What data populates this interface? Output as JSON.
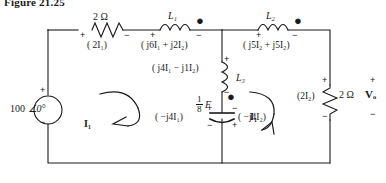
{
  "figure": {
    "title": "Figure 21.25"
  },
  "source": {
    "label": "100",
    "angle": "∠0°",
    "plus": "+",
    "minus": "−"
  },
  "components": {
    "resistor_top": {
      "value": "2 Ω",
      "drop": "( 2I₁)",
      "plus": "+",
      "minus": "−"
    },
    "inductor_L1": {
      "name": "L₁",
      "drop": "( j6I₁ + j2I₂)",
      "plus": "+",
      "minus": "−",
      "dot": "●"
    },
    "inductor_L2": {
      "name": "L₂",
      "drop": "( j5I₂ + j5I₂)",
      "plus": "+",
      "minus": "−",
      "dot": "●"
    },
    "inductor_L3": {
      "name": "L₃",
      "drop": "( j4I₁ − j1I₂)",
      "plus": "+",
      "minus": "−",
      "dot": "●"
    },
    "capacitor": {
      "value_num": "1",
      "value_den": "8",
      "value_unit": "F",
      "drop_left": "( −j4I₁)",
      "drop_right": "( −j4I₂)",
      "plus": "+",
      "minus": "−"
    },
    "resistor_right": {
      "value": "2 Ω",
      "drop": "(2I₂)",
      "output": "Vₒ",
      "plus": "+",
      "minus": "−"
    }
  },
  "meshes": {
    "left": {
      "label": "I₁"
    },
    "right": {
      "label": "I₁"
    }
  },
  "colors": {
    "wire": "#1a1a1a",
    "text": "#1a1a1a",
    "background": "#ffffff"
  }
}
